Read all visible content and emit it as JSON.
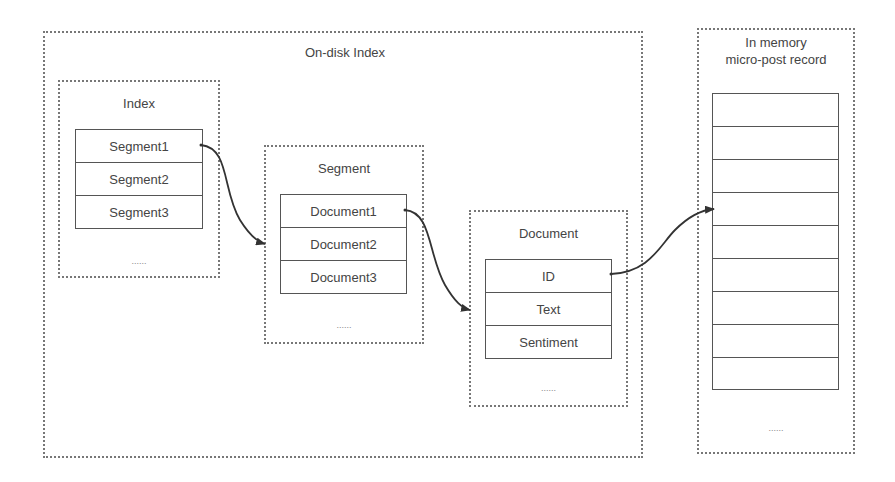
{
  "diagram": {
    "on_disk": {
      "title": "On-disk Index",
      "index": {
        "title": "Index",
        "rows": [
          "Segment1",
          "Segment2",
          "Segment3"
        ],
        "more": "......"
      },
      "segment": {
        "title": "Segment",
        "rows": [
          "Document1",
          "Document2",
          "Document3"
        ],
        "more": "......"
      },
      "document": {
        "title": "Document",
        "rows": [
          "ID",
          "Text",
          "Sentiment"
        ],
        "more": "......"
      }
    },
    "in_memory": {
      "title_line1": "In memory",
      "title_line2": "micro-post record",
      "rows": [
        "",
        "",
        "",
        "",
        "",
        "",
        "",
        "",
        ""
      ],
      "more": "......"
    },
    "edges": [
      {
        "from": "Segment1",
        "to": "Segment box"
      },
      {
        "from": "Document1",
        "to": "Document box"
      },
      {
        "from": "ID",
        "to": "In memory micro-post record row 4"
      }
    ]
  }
}
